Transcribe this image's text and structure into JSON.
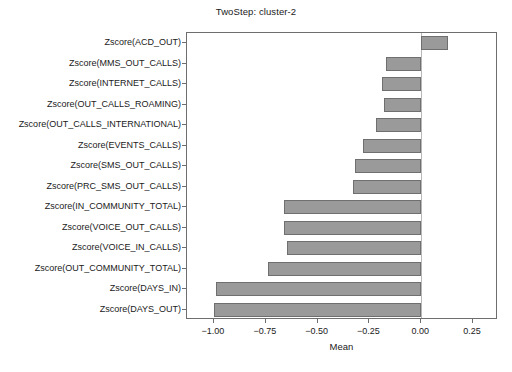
{
  "chart_data": {
    "type": "bar",
    "orientation": "horizontal",
    "title": "TwoStep: cluster-2",
    "xlabel": "Mean",
    "ylabel": "",
    "xlim": [
      -1.13,
      0.37
    ],
    "grid": false,
    "legend": null,
    "xticks": [
      -1.0,
      -0.75,
      -0.5,
      -0.25,
      0.0,
      0.25
    ],
    "xticklabels": [
      "−1.00",
      "−0.75",
      "−0.50",
      "−0.25",
      "0.00",
      "0.25"
    ],
    "zero_reference_line": 0.0,
    "bar_color": "#9a9a9a",
    "bar_edge_color": "#6f6f6f",
    "categories": [
      "Zscore(ACD_OUT)",
      "Zscore(MMS_OUT_CALLS)",
      "Zscore(INTERNET_CALLS)",
      "Zscore(OUT_CALLS_ROAMING)",
      "Zscore(OUT_CALLS_INTERNATIONAL)",
      "Zscore(EVENTS_CALLS)",
      "Zscore(SMS_OUT_CALLS)",
      "Zscore(PRC_SMS_OUT_CALLS)",
      "Zscore(IN_COMMUNITY_TOTAL)",
      "Zscore(VOICE_OUT_CALLS)",
      "Zscore(VOICE_IN_CALLS)",
      "Zscore(OUT_COMMUNITY_TOTAL)",
      "Zscore(DAYS_IN)",
      "Zscore(DAYS_OUT)"
    ],
    "values": [
      0.13,
      -0.17,
      -0.19,
      -0.18,
      -0.22,
      -0.28,
      -0.32,
      -0.33,
      -0.66,
      -0.66,
      -0.65,
      -0.74,
      -0.99,
      -1.0
    ]
  }
}
